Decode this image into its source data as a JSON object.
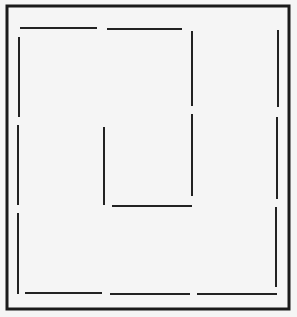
{
  "diagram": {
    "type": "line-drawing",
    "background": "#f5f5f5",
    "frame": {
      "x": 7,
      "y": 6,
      "width": 282,
      "height": 303,
      "stroke": "#1a1a1a",
      "stroke_width": 3
    },
    "segments": [
      {
        "id": "top-1",
        "x1": 20,
        "y1": 28,
        "x2": 97,
        "y2": 28
      },
      {
        "id": "top-2",
        "x1": 107,
        "y1": 29,
        "x2": 182,
        "y2": 29
      },
      {
        "id": "inner-right-1",
        "x1": 192,
        "y1": 31,
        "x2": 192,
        "y2": 106
      },
      {
        "id": "inner-right-2",
        "x1": 192,
        "y1": 114,
        "x2": 192,
        "y2": 196
      },
      {
        "id": "inner-bottom",
        "x1": 112,
        "y1": 206,
        "x2": 192,
        "y2": 206
      },
      {
        "id": "inner-left",
        "x1": 104,
        "y1": 127,
        "x2": 104,
        "y2": 205
      },
      {
        "id": "left-1",
        "x1": 19,
        "y1": 37,
        "x2": 19,
        "y2": 117
      },
      {
        "id": "left-2",
        "x1": 18,
        "y1": 125,
        "x2": 18,
        "y2": 205
      },
      {
        "id": "left-3",
        "x1": 18,
        "y1": 213,
        "x2": 18,
        "y2": 294
      },
      {
        "id": "bottom-1",
        "x1": 25,
        "y1": 293,
        "x2": 102,
        "y2": 293
      },
      {
        "id": "bottom-2",
        "x1": 110,
        "y1": 294,
        "x2": 190,
        "y2": 294
      },
      {
        "id": "bottom-3",
        "x1": 197,
        "y1": 294,
        "x2": 277,
        "y2": 294
      },
      {
        "id": "right-1",
        "x1": 278,
        "y1": 30,
        "x2": 278,
        "y2": 107
      },
      {
        "id": "right-2",
        "x1": 277,
        "y1": 117,
        "x2": 277,
        "y2": 199
      },
      {
        "id": "right-3",
        "x1": 276,
        "y1": 207,
        "x2": 276,
        "y2": 287
      }
    ],
    "segment_stroke": "#222222",
    "segment_width": 2
  }
}
